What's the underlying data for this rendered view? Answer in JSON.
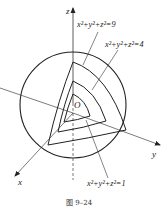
{
  "diagram": {
    "axes": {
      "z": "z",
      "x": "x",
      "y": "y",
      "origin": "O"
    },
    "surfaces": [
      {
        "label": "x²+y²+z²=9",
        "radius": 3
      },
      {
        "label": "x²+y²+z²=4",
        "radius": 2
      },
      {
        "label": "x²+y²+z²=1",
        "radius": 1
      }
    ],
    "caption": "图 9–24",
    "colors": {
      "stroke": "#222222",
      "background": "#ffffff"
    }
  }
}
